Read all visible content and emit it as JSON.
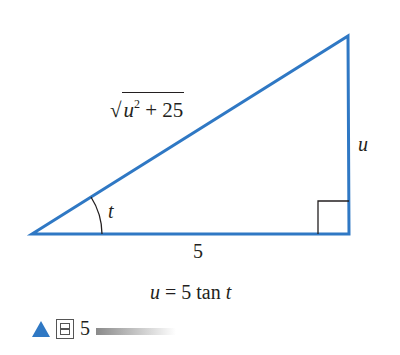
{
  "figure": {
    "hypotenuse_label": {
      "radical": "√",
      "var": "u",
      "exp": "2",
      "rest": " + 25"
    },
    "opposite_label": "u",
    "angle_label": "t",
    "adjacent_label": "5",
    "equation": {
      "lhs": "u",
      "mid": " = 5 tan ",
      "rhs": "t"
    },
    "caption": {
      "char": "图",
      "number": "5"
    },
    "colors": {
      "triangle": "#2f78c4",
      "text": "#231f20",
      "marker": "#2f78c4"
    }
  }
}
